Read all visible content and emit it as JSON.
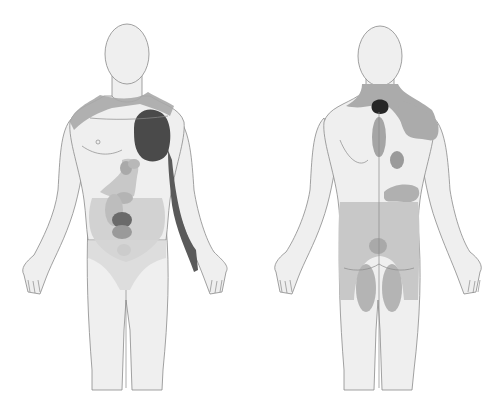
{
  "figure": {
    "type": "referred-pain-body-map",
    "views": [
      {
        "id": "anterior",
        "label": ""
      },
      {
        "id": "posterior",
        "label": ""
      }
    ]
  },
  "colors": {
    "background": "#ffffff",
    "skin": "#efefef",
    "outline": "#8a8a8a",
    "zone_light": "#c8c8c8",
    "zone_mid": "#a9a9a9",
    "zone_dark": "#4a4a4a",
    "zone_darkest": "#262626"
  }
}
